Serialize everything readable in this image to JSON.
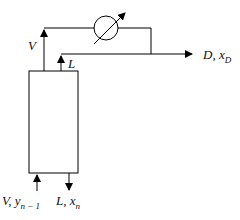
{
  "diagram": {
    "labels": {
      "vapor_up": "V",
      "reflux": "L",
      "distillate": "D, x",
      "distillate_sub": "D",
      "bottom_vapor": "V, y",
      "bottom_vapor_sub": "n − 1",
      "bottom_liquid": "L, x",
      "bottom_liquid_sub": "n"
    },
    "nodes": [
      {
        "id": "column",
        "type": "rectangle"
      },
      {
        "id": "condenser",
        "type": "circle-with-adjustment-arrow"
      }
    ],
    "edges": [
      {
        "from": "column",
        "to": "condenser",
        "label": "V"
      },
      {
        "from": "condenser",
        "to": "output",
        "label": "D, x_D"
      },
      {
        "from": "condenser",
        "to": "column",
        "label": "L"
      },
      {
        "from": "input",
        "to": "column",
        "label": "V, y_n-1"
      },
      {
        "from": "column",
        "to": "output",
        "label": "L, x_n"
      }
    ]
  }
}
